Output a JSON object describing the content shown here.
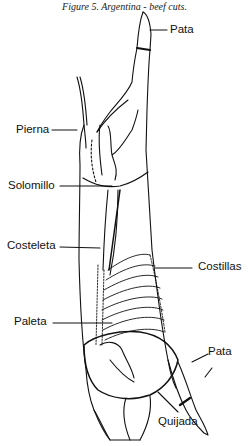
{
  "figure": {
    "caption": "Figure 5. Argentina - beef cuts.",
    "labels": {
      "pata_top": "Pata",
      "pierna": "Pierna",
      "solomillo": "Solomillo",
      "costeleta": "Costeleta",
      "costillas": "Costillas",
      "paleta": "Paleta",
      "pata_bottom": "Pata",
      "quijada": "Quijada"
    }
  }
}
